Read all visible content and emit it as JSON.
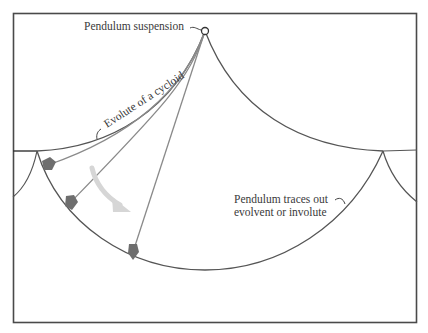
{
  "labels": {
    "suspension": "Pendulum suspension",
    "evolute": "Evolute of a cycloid",
    "traces_line1": "Pendulum traces out",
    "traces_line2": "evolvent or involute"
  },
  "colors": {
    "frame": "#4a4a4a",
    "curve": "#555555",
    "rod": "#8a8a8a",
    "bob": "#6e6e6e",
    "motion_arrow": "#d6d6d6",
    "text": "#3a3a3a"
  },
  "geometry": {
    "suspension_point": [
      205,
      31
    ],
    "left_cusp": [
      37,
      151
    ],
    "right_cusp": [
      383,
      151
    ],
    "lower_curve_bottom": [
      205,
      270
    ],
    "bobs": [
      [
        48,
        165
      ],
      [
        70,
        203
      ],
      [
        133,
        252
      ]
    ]
  }
}
